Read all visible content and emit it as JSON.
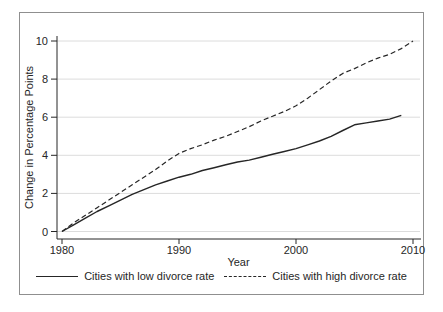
{
  "chart_data": {
    "type": "line",
    "title": "",
    "xlabel": "Year",
    "ylabel": "Change in Percentage Points",
    "xlim": [
      1980,
      2010
    ],
    "ylim": [
      0,
      10
    ],
    "x_ticks": [
      "1980",
      "1990",
      "2000",
      "2010"
    ],
    "y_ticks": [
      "0",
      "2",
      "4",
      "6",
      "8",
      "10"
    ],
    "grid": "horizontal-light",
    "legend_position": "bottom-center",
    "colors": {
      "line": "#262626",
      "grid": "#dcdcdc",
      "axis": "#262626",
      "text": "#262626",
      "border": "#8f8f8f",
      "background": "#ffffff"
    },
    "series": [
      {
        "name": "Cities with low divorce rate",
        "style": "solid",
        "points": [
          [
            1980,
            0
          ],
          [
            1981,
            0.35
          ],
          [
            1982,
            0.7
          ],
          [
            1983,
            1.05
          ],
          [
            1984,
            1.35
          ],
          [
            1985,
            1.65
          ],
          [
            1986,
            1.95
          ],
          [
            1987,
            2.2
          ],
          [
            1988,
            2.45
          ],
          [
            1989,
            2.65
          ],
          [
            1990,
            2.85
          ],
          [
            1991,
            3.0
          ],
          [
            1992,
            3.2
          ],
          [
            1993,
            3.35
          ],
          [
            1994,
            3.5
          ],
          [
            1995,
            3.65
          ],
          [
            1996,
            3.75
          ],
          [
            1997,
            3.9
          ],
          [
            1998,
            4.05
          ],
          [
            1999,
            4.2
          ],
          [
            2000,
            4.35
          ],
          [
            2001,
            4.55
          ],
          [
            2002,
            4.75
          ],
          [
            2003,
            5.0
          ],
          [
            2004,
            5.3
          ],
          [
            2005,
            5.6
          ],
          [
            2006,
            5.7
          ],
          [
            2007,
            5.8
          ],
          [
            2008,
            5.9
          ],
          [
            2009,
            6.1
          ]
        ]
      },
      {
        "name": "Cities with high divorce rate",
        "style": "dashed",
        "points": [
          [
            1980,
            0
          ],
          [
            1981,
            0.45
          ],
          [
            1982,
            0.85
          ],
          [
            1983,
            1.25
          ],
          [
            1984,
            1.65
          ],
          [
            1985,
            2.05
          ],
          [
            1986,
            2.45
          ],
          [
            1987,
            2.85
          ],
          [
            1988,
            3.25
          ],
          [
            1989,
            3.7
          ],
          [
            1990,
            4.1
          ],
          [
            1991,
            4.35
          ],
          [
            1992,
            4.55
          ],
          [
            1993,
            4.8
          ],
          [
            1994,
            5.0
          ],
          [
            1995,
            5.25
          ],
          [
            1996,
            5.5
          ],
          [
            1997,
            5.8
          ],
          [
            1998,
            6.05
          ],
          [
            1999,
            6.3
          ],
          [
            2000,
            6.6
          ],
          [
            2001,
            7.0
          ],
          [
            2002,
            7.45
          ],
          [
            2003,
            7.9
          ],
          [
            2004,
            8.3
          ],
          [
            2005,
            8.55
          ],
          [
            2006,
            8.85
          ],
          [
            2007,
            9.1
          ],
          [
            2008,
            9.3
          ],
          [
            2009,
            9.6
          ],
          [
            2010,
            10.0
          ]
        ]
      }
    ]
  }
}
